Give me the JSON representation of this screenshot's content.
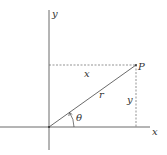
{
  "diagram": {
    "labels": {
      "y_axis": "y",
      "x_axis": "x",
      "point": "P",
      "horizontal_leg": "x",
      "vertical_leg": "y",
      "radius": "r",
      "angle": "θ"
    },
    "colors": {
      "line": "#444444",
      "dashed": "#666666",
      "text": "#333333"
    }
  }
}
